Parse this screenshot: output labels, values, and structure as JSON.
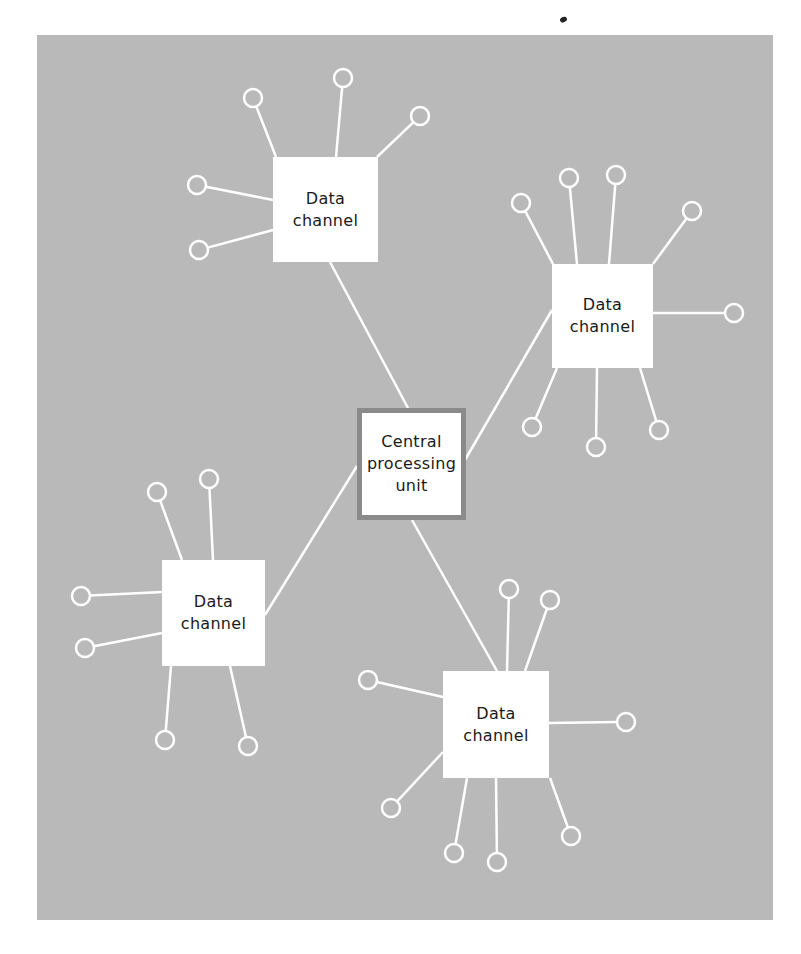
{
  "diagram": {
    "type": "star-network",
    "background_color": "#b9b9b9",
    "line_color": "#ffffff",
    "cpu_border_color": "#8a8a8a",
    "cpu": {
      "label_lines": [
        "Central",
        "processing",
        "unit"
      ],
      "box": {
        "x": 357,
        "y": 408,
        "w": 109,
        "h": 112
      }
    },
    "data_channels": [
      {
        "id": "top-left",
        "label_lines": [
          "Data",
          "channel"
        ],
        "box": {
          "x": 273,
          "y": 157,
          "w": 105,
          "h": 105
        },
        "link_to_cpu": {
          "from": [
            330,
            262
          ],
          "to": [
            408,
            408
          ]
        },
        "devices": [
          {
            "stem": [
              276,
              157
            ],
            "circle": [
              253,
              98
            ]
          },
          {
            "stem": [
              336,
              157
            ],
            "circle": [
              343,
              78
            ]
          },
          {
            "stem": [
              377,
              157
            ],
            "circle": [
              420,
              116
            ]
          },
          {
            "stem": [
              273,
              200
            ],
            "circle": [
              197,
              185
            ]
          },
          {
            "stem": [
              273,
              230
            ],
            "circle": [
              199,
              250
            ]
          }
        ]
      },
      {
        "id": "top-right",
        "label_lines": [
          "Data",
          "channel"
        ],
        "box": {
          "x": 552,
          "y": 264,
          "w": 101,
          "h": 104
        },
        "link_to_cpu": {
          "from": [
            552,
            310
          ],
          "to": [
            465,
            460
          ]
        },
        "devices": [
          {
            "stem": [
              553,
              264
            ],
            "circle": [
              521,
              203
            ]
          },
          {
            "stem": [
              577,
              264
            ],
            "circle": [
              569,
              178
            ]
          },
          {
            "stem": [
              609,
              264
            ],
            "circle": [
              616,
              175
            ]
          },
          {
            "stem": [
              653,
              264
            ],
            "circle": [
              692,
              211
            ]
          },
          {
            "stem": [
              653,
              313
            ],
            "circle": [
              734,
              313
            ]
          },
          {
            "stem": [
              557,
              368
            ],
            "circle": [
              532,
              427
            ]
          },
          {
            "stem": [
              597,
              368
            ],
            "circle": [
              596,
              447
            ]
          },
          {
            "stem": [
              640,
              368
            ],
            "circle": [
              659,
              430
            ]
          }
        ]
      },
      {
        "id": "bottom-left",
        "label_lines": [
          "Data",
          "channel"
        ],
        "box": {
          "x": 162,
          "y": 560,
          "w": 103,
          "h": 106
        },
        "link_to_cpu": {
          "from": [
            265,
            615
          ],
          "to": [
            357,
            466
          ]
        },
        "devices": [
          {
            "stem": [
              182,
              560
            ],
            "circle": [
              157,
              492
            ]
          },
          {
            "stem": [
              213,
              560
            ],
            "circle": [
              209,
              479
            ]
          },
          {
            "stem": [
              162,
              592
            ],
            "circle": [
              81,
              596
            ]
          },
          {
            "stem": [
              162,
              633
            ],
            "circle": [
              85,
              648
            ]
          },
          {
            "stem": [
              171,
              666
            ],
            "circle": [
              165,
              740
            ]
          },
          {
            "stem": [
              230,
              666
            ],
            "circle": [
              248,
              746
            ]
          }
        ]
      },
      {
        "id": "bottom-right",
        "label_lines": [
          "Data",
          "channel"
        ],
        "box": {
          "x": 443,
          "y": 671,
          "w": 106,
          "h": 107
        },
        "link_to_cpu": {
          "from": [
            497,
            671
          ],
          "to": [
            412,
            520
          ]
        },
        "devices": [
          {
            "stem": [
              443,
              697
            ],
            "circle": [
              368,
              680
            ]
          },
          {
            "stem": [
              507,
              671
            ],
            "circle": [
              509,
              589
            ]
          },
          {
            "stem": [
              525,
              671
            ],
            "circle": [
              550,
              600
            ]
          },
          {
            "stem": [
              549,
              723
            ],
            "circle": [
              626,
              722
            ]
          },
          {
            "stem": [
              443,
              752
            ],
            "circle": [
              391,
              808
            ]
          },
          {
            "stem": [
              467,
              778
            ],
            "circle": [
              454,
              853
            ]
          },
          {
            "stem": [
              496,
              778
            ],
            "circle": [
              497,
              862
            ]
          },
          {
            "stem": [
              550,
              778
            ],
            "circle": [
              571,
              836
            ]
          }
        ]
      }
    ],
    "device_circle_radius": 9
  }
}
